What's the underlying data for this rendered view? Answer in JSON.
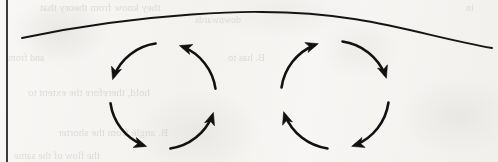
{
  "page": {
    "width": 498,
    "height": 162,
    "background_color": "#f6f5f3",
    "ink_color": "#111111",
    "bleed_text_color": "#c9c7c1"
  },
  "margin_rule": {
    "name": "left-margin-rule",
    "x": 7,
    "y_top": 0,
    "y_bottom": 162,
    "thickness": 2,
    "color": "#3a3a3a"
  },
  "curve": {
    "name": "top-curved-line",
    "label": "curved boundary line",
    "start": {
      "x": 22,
      "y": 38
    },
    "apex": {
      "x": 262,
      "y": 12
    },
    "end": {
      "x": 492,
      "y": 48
    },
    "thickness": 1.8,
    "color": "#141414"
  },
  "circles": [
    {
      "id": "left-loop",
      "label": "Left circulation loop",
      "direction": "counterclockwise",
      "center": {
        "x": 163,
        "y": 96
      },
      "radius": 53,
      "stroke_width": 2.6,
      "color": "#111111",
      "segments": [
        {
          "start_deg": 98,
          "sweep_deg": 64,
          "arrowhead_at": "end"
        },
        {
          "start_deg": 188,
          "sweep_deg": 64,
          "arrowhead_at": "end"
        },
        {
          "start_deg": 278,
          "sweep_deg": 64,
          "arrowhead_at": "end"
        },
        {
          "start_deg": 8,
          "sweep_deg": 64,
          "arrowhead_at": "end"
        }
      ]
    },
    {
      "id": "right-loop",
      "label": "Right circulation loop",
      "direction": "clockwise",
      "center": {
        "x": 335,
        "y": 95
      },
      "radius": 54,
      "stroke_width": 2.6,
      "color": "#111111",
      "segments": [
        {
          "start_deg": 82,
          "sweep_deg": -64,
          "arrowhead_at": "end"
        },
        {
          "start_deg": 352,
          "sweep_deg": -64,
          "arrowhead_at": "end"
        },
        {
          "start_deg": 262,
          "sweep_deg": -64,
          "arrowhead_at": "end"
        },
        {
          "start_deg": 172,
          "sweep_deg": -64,
          "arrowhead_at": "end"
        }
      ]
    }
  ],
  "bleed_through_text": [
    {
      "text": "they know from theory that",
      "x": 40,
      "y": 1,
      "size": 11
    },
    {
      "text": "downwards",
      "x": 195,
      "y": 14,
      "size": 10
    },
    {
      "text": "B. has to",
      "x": 228,
      "y": 52,
      "size": 10.5
    },
    {
      "text": "and from",
      "x": 8,
      "y": 52,
      "size": 10
    },
    {
      "text": "hold, therefore the extent to",
      "x": 28,
      "y": 86,
      "size": 11
    },
    {
      "text": "B. angle from the shorter",
      "x": 58,
      "y": 126,
      "size": 11
    },
    {
      "text": "the flow of the same",
      "x": 14,
      "y": 150,
      "size": 10.5
    },
    {
      "text": "in",
      "x": 466,
      "y": 2,
      "size": 10
    }
  ]
}
